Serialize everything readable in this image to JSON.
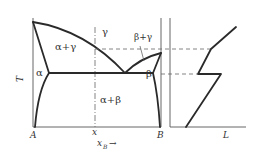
{
  "diagram": {
    "type": "phase-diagram-with-structure-plot",
    "phase_diagram": {
      "y_axis_label": "T",
      "x_axis_label": "x",
      "x_axis_subscript": "B",
      "x_axis_arrow": "→",
      "left_end_label": "A",
      "right_end_label": "B",
      "composition_marker": "x",
      "regions": {
        "alpha_gamma": "α+γ",
        "gamma": "γ",
        "beta_gamma": "β+γ",
        "alpha": "α",
        "beta": "β",
        "alpha_beta": "α+β"
      }
    },
    "right_plot": {
      "x_axis_label": "L"
    },
    "colors": {
      "line": "#2a2a2a",
      "axis": "#555555",
      "dash": "#666666",
      "background": "#ffffff"
    }
  }
}
